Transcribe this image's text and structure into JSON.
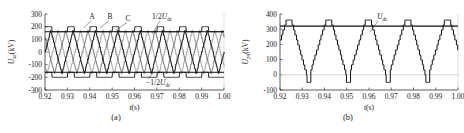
{
  "figure": {
    "panels": [
      {
        "id": "a",
        "caption": "(a)",
        "xlabel_main": "t",
        "xlabel_unit": "(s)",
        "ylabel_main": "U",
        "ylabel_sub": "ac",
        "ylabel_unit": "(kV)",
        "annotations": [
          {
            "name": "phase-a-label",
            "text": "A"
          },
          {
            "name": "phase-b-label",
            "text": "B"
          },
          {
            "name": "phase-c-label",
            "text": "C"
          },
          {
            "name": "half-udc-pos-label",
            "text": "1/2U",
            "sub": "dc"
          },
          {
            "name": "half-udc-neg-label",
            "text": "−1/2U",
            "sub": "dc"
          }
        ]
      },
      {
        "id": "b",
        "caption": "(b)",
        "xlabel_main": "t",
        "xlabel_unit": "(s)",
        "ylabel_main": "U",
        "ylabel_sub": "pn",
        "ylabel_unit": "(kV)",
        "annotations": [
          {
            "name": "udc-label",
            "text": "U",
            "sub": "dc"
          }
        ]
      }
    ]
  },
  "chart_data": [
    {
      "type": "line",
      "panel": "a",
      "title": "",
      "xlabel": "t(s)",
      "ylabel": "Uac(kV)",
      "xlim": [
        0.92,
        1.0
      ],
      "ylim": [
        -300,
        300
      ],
      "xticks": [
        "0.92",
        "0.93",
        "0.94",
        "0.95",
        "0.96",
        "0.97",
        "0.98",
        "0.99",
        "1.00"
      ],
      "xtick_values": [
        0.92,
        0.93,
        0.94,
        0.95,
        0.96,
        0.97,
        0.98,
        0.99,
        1.0
      ],
      "yticks": [
        "300",
        "200",
        "100",
        "0",
        "-100",
        "-200",
        "-300"
      ],
      "ytick_values": [
        300,
        200,
        100,
        0,
        -100,
        -200,
        -300
      ],
      "grid": false,
      "legend_position": "inline-annotations",
      "reference_lines": [
        {
          "name": "1/2Udc",
          "value": 160,
          "color": "#111111"
        },
        {
          "name": "-1/2Udc",
          "value": -160,
          "color": "#111111"
        }
      ],
      "series": [
        {
          "name": "A",
          "color": "#111111",
          "waveform": "three-level-staircase",
          "amplitude": 170,
          "frequency_hz": 100,
          "phase_deg": 0
        },
        {
          "name": "B",
          "color": "#555555",
          "waveform": "three-level-staircase",
          "amplitude": 170,
          "frequency_hz": 100,
          "phase_deg": 120
        },
        {
          "name": "C",
          "color": "#888888",
          "waveform": "three-level-staircase",
          "amplitude": 170,
          "frequency_hz": 100,
          "phase_deg": 240
        },
        {
          "name": "envelope-upper",
          "color": "#111111",
          "waveform": "square-pulse",
          "high": 200,
          "low": 160,
          "frequency_hz": 100
        },
        {
          "name": "envelope-lower",
          "color": "#111111",
          "waveform": "square-pulse",
          "high": -160,
          "low": -200,
          "frequency_hz": 100
        }
      ]
    },
    {
      "type": "line",
      "panel": "b",
      "title": "",
      "xlabel": "t(s)",
      "ylabel": "Upn(kV)",
      "xlim": [
        0.92,
        1.0
      ],
      "ylim": [
        -100,
        400
      ],
      "xticks": [
        "0.92",
        "0.93",
        "0.94",
        "0.95",
        "0.96",
        "0.97",
        "0.98",
        "0.99",
        "1.00"
      ],
      "xtick_values": [
        0.92,
        0.93,
        0.94,
        0.95,
        0.96,
        0.97,
        0.98,
        0.99,
        1.0
      ],
      "yticks": [
        "400",
        "300",
        "200",
        "100",
        "0",
        "-100"
      ],
      "ytick_values": [
        400,
        300,
        200,
        100,
        0,
        -100
      ],
      "grid": false,
      "legend_position": "inline-annotation",
      "reference_lines": [
        {
          "name": "Udc",
          "value": 320,
          "color": "#111111"
        },
        {
          "name": "zero",
          "value": 0,
          "color": "#aaaaaa"
        }
      ],
      "series": [
        {
          "name": "Upn",
          "color": "#111111",
          "waveform": "staircase-trapezoid",
          "peak": 360,
          "trough": -50,
          "frequency_hz": 55,
          "phase_deg": 0
        }
      ]
    }
  ]
}
